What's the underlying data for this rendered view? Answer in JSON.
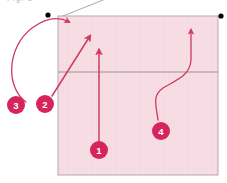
{
  "figure": {
    "caption_clipped": "Fig. 1",
    "background_color": "#ffffff",
    "panel": {
      "fill_color": "#f7dde4",
      "border_color": "#b5a8ad",
      "x": 58,
      "y": 16,
      "width": 160,
      "height": 159,
      "divider_y": 72,
      "divider_color": "#9e9298"
    },
    "corner_dots": [
      {
        "name": "top-left-node",
        "cx": 48,
        "cy": 15,
        "r": 2.6,
        "color": "#000000"
      },
      {
        "name": "top-right-node",
        "cx": 221,
        "cy": 16,
        "r": 2.6,
        "color": "#000000"
      }
    ],
    "leader_line": {
      "color": "#a0a0a0",
      "from_x": 58,
      "from_y": 18,
      "to_x": 108,
      "to_y": -2
    },
    "arrow_color": "#cf3a63",
    "marker_fill": "#d6245c",
    "marker_radius": 9,
    "callouts": [
      {
        "id": "callout-1",
        "label": "1",
        "marker_x": 99,
        "marker_y": 150,
        "target": "lower-panel-vertical-riser",
        "path": "M 99 141 L 99 50",
        "arrow_angle": -90
      },
      {
        "id": "callout-2",
        "label": "2",
        "marker_x": 45,
        "marker_y": 104,
        "target": "panel-divider-left-junction",
        "path": "M 52 96 L 90 36",
        "arrow_angle": -58
      },
      {
        "id": "callout-3",
        "label": "3",
        "marker_x": 16,
        "marker_y": 105,
        "target": "panel-top-left-corner",
        "path": "M 26 102 C 6 88, 6 48, 32 28 C 46 18, 58 16, 69 22",
        "arrow_angle": -36
      },
      {
        "id": "callout-4",
        "label": "4",
        "marker_x": 161,
        "marker_y": 131,
        "target": "panel-top-right-region",
        "path": "M 158 120 C 156 104, 152 96, 163 88 C 176 80, 190 76, 191 60 L 191 30",
        "arrow_angle": -90
      }
    ]
  }
}
